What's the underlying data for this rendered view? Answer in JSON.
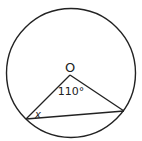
{
  "diagram": {
    "type": "circle-geometry",
    "stroke_color": "#222222",
    "background": "#ffffff",
    "circle": {
      "cx": 71,
      "cy": 73,
      "r": 65
    },
    "center_label": "O",
    "points": {
      "O": {
        "x": 70,
        "y": 75
      },
      "A": {
        "x": 26,
        "y": 119
      },
      "B": {
        "x": 124,
        "y": 111
      }
    },
    "angle_labels": {
      "center_angle": "110°",
      "unknown_angle": "x"
    }
  }
}
